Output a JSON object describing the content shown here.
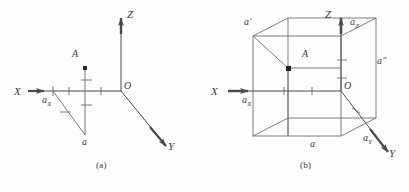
{
  "figure": {
    "background_color": "#fdfdfd",
    "stroke_color": "#4a4a4a",
    "label_color": "#2e2e2e",
    "panels": [
      {
        "caption": "(a)",
        "caption_x": 96,
        "caption_y": 166,
        "description": "Three mutually perpendicular axes X, Y, Z with origin O; point A above the X-axis joined by a vertical segment to point a, and a diagonal from a to the X-axis point a_x",
        "axes": [
          {
            "name": "X",
            "label": "X",
            "label_x": 14,
            "label_y": 94,
            "arrow": "right"
          },
          {
            "name": "Y",
            "label": "Y",
            "label_x": 168,
            "label_y": 149,
            "arrow": "down-right"
          },
          {
            "name": "Z",
            "label": "Z",
            "label_x": 127,
            "label_y": 13,
            "arrow": "up"
          }
        ],
        "points": [
          {
            "name": "origin",
            "label": "O",
            "label_x": 121,
            "label_y": 88
          },
          {
            "name": "point-A",
            "label": "A",
            "label_x": 72,
            "label_y": 55,
            "marker": true
          },
          {
            "name": "point-a",
            "label": "a",
            "label_x": 81,
            "label_y": 142
          },
          {
            "name": "point-ax",
            "label": "a",
            "sub": "X",
            "label_x": 43,
            "label_y": 107
          }
        ]
      },
      {
        "caption": "(b)",
        "caption_x": 300,
        "caption_y": 166,
        "description": "Same axis triad drawn inside a parallelepiped (cube in oblique projection) whose vertices are labelled a, a', a'', a_x, a_y, a_z with point A at an interior vertex",
        "axes": [
          {
            "name": "X",
            "label": "X",
            "label_x": 214,
            "label_y": 94,
            "arrow": "right"
          },
          {
            "name": "Y",
            "label": "Y",
            "label_x": 390,
            "label_y": 156,
            "arrow": "down-right"
          },
          {
            "name": "Z",
            "label": "Z",
            "label_x": 329,
            "label_y": 13,
            "arrow": "up"
          }
        ],
        "points": [
          {
            "name": "origin",
            "label": "O",
            "label_x": 340,
            "label_y": 88
          },
          {
            "name": "point-A",
            "label": "A",
            "label_x": 303,
            "label_y": 52,
            "marker": true
          },
          {
            "name": "point-a",
            "label": "a",
            "label_x": 310,
            "label_y": 145
          },
          {
            "name": "point-a-prime",
            "label": "a′",
            "label_x": 245,
            "label_y": 21
          },
          {
            "name": "point-a-double-prime",
            "label": "a″",
            "label_x": 376,
            "label_y": 62
          },
          {
            "name": "point-ax",
            "label": "a",
            "sub": "X",
            "label_x": 243,
            "label_y": 107
          },
          {
            "name": "point-ay",
            "label": "a",
            "sub": "Y",
            "label_x": 364,
            "label_y": 140
          },
          {
            "name": "point-az",
            "label": "a",
            "sub": "Z",
            "label_x": 351,
            "label_y": 23
          }
        ]
      }
    ]
  }
}
